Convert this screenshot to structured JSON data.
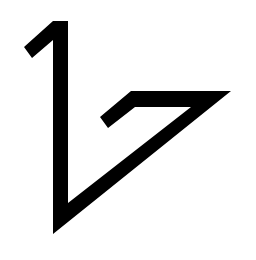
{
  "logo": {
    "name": "1-7 monogram mark",
    "fill": "#000000",
    "background": "#ffffff",
    "points": "24,47 53,21 68,21 68,203 191,107 135,107 108,128 100,117 131,91 231,91 53,234 53,40 32,58"
  }
}
